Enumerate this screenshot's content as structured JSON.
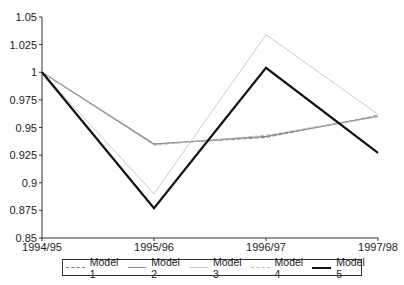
{
  "chart_data": {
    "type": "line",
    "title": "",
    "xlabel": "",
    "ylabel": "",
    "categories": [
      "1994/95",
      "1995/96",
      "1996/97",
      "1997/98"
    ],
    "ylim": [
      0.85,
      1.05
    ],
    "yticks": [
      "1.05",
      "1.025",
      "1",
      "0.975",
      "0.95",
      "0.925",
      "0.9",
      "0.875",
      "0.85"
    ],
    "grid": false,
    "legend_position": "bottom",
    "series": [
      {
        "name": "Model 1",
        "values": [
          1.0,
          0.935,
          0.941,
          0.961
        ],
        "color": "#777777",
        "style": "dashed",
        "width": 1
      },
      {
        "name": "Model 2",
        "values": [
          1.0,
          0.935,
          0.942,
          0.96
        ],
        "color": "#888888",
        "style": "solid",
        "width": 1.2
      },
      {
        "name": "Model 3",
        "values": [
          1.0,
          0.89,
          1.034,
          0.962
        ],
        "color": "#cccccc",
        "style": "solid",
        "width": 1
      },
      {
        "name": "Model 4",
        "values": [
          1.0,
          0.934,
          0.943,
          0.96
        ],
        "color": "#bbbbbb",
        "style": "dashed",
        "width": 1
      },
      {
        "name": "Model 5",
        "values": [
          1.0,
          0.877,
          1.004,
          0.927
        ],
        "color": "#111111",
        "style": "solid",
        "width": 2.2
      }
    ]
  },
  "legend": {
    "items": [
      "Model 1",
      "Model 2",
      "Model 3",
      "Model 4",
      "Model 5"
    ]
  }
}
